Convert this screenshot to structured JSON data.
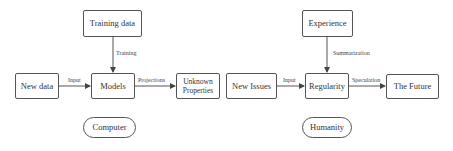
{
  "colors": {
    "stroke": "#555555",
    "text": "#333333",
    "background": "#ffffff"
  },
  "computer": {
    "source": "Training data",
    "source_edge": "Training",
    "input": "New data",
    "input_edge": "Input",
    "core": "Models",
    "output_edge": "Projections",
    "output": "Unknown Properties",
    "caption": "Computer"
  },
  "humanity": {
    "source": "Experience",
    "source_edge": "Summarization",
    "input": "New Issues",
    "input_edge": "Input",
    "core": "Regularity",
    "output_edge": "Speculation",
    "output": "The Future",
    "caption": "Humanity"
  }
}
